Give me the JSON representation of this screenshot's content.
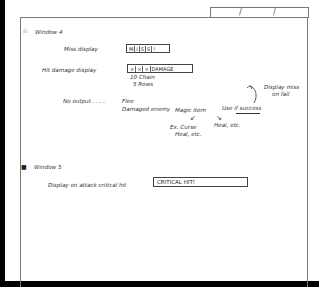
{
  "tab": {
    "slashes": [
      "/",
      "/"
    ]
  },
  "window4": {
    "icon": "star-icon",
    "icon_glyph": "☆",
    "title": "Window 4",
    "miss": {
      "label": "Miss display",
      "cells": [
        "M",
        "I",
        "S",
        "S",
        "!"
      ]
    },
    "hit": {
      "label": "Hit damage display",
      "cells": [
        "×",
        "×",
        "×"
      ],
      "value": "DAMAGE",
      "note_line1": "10 Chain",
      "note_line2": "5 Rows"
    },
    "no_output": {
      "label": "No output . . . .",
      "flee": "Flee",
      "damaged_enemy": "Damaged enemy",
      "magic_item": "Magic item",
      "magic_item_examples_line1": "Ex. Curse",
      "magic_item_examples_line2": "Heal, etc.",
      "use_if_success": "Use if success",
      "heal_etc": "Heal, etc.",
      "display_miss_line1": "Display miss",
      "display_miss_line2": "on fail"
    }
  },
  "window5": {
    "icon": "lock-icon",
    "icon_glyph": "🔒",
    "title": "Window 5",
    "critical": {
      "label": "Display on attack critical hit",
      "value": "CRITICAL HIT!"
    }
  }
}
